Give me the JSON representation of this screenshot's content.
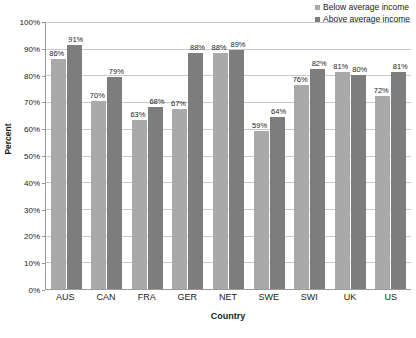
{
  "chart_data": {
    "type": "bar",
    "title": "",
    "xlabel": "Country",
    "ylabel": "Percent",
    "ylim": [
      0,
      100
    ],
    "y_ticks": [
      "0%",
      "10%",
      "20%",
      "30%",
      "40%",
      "50%",
      "60%",
      "70%",
      "80%",
      "90%",
      "100%"
    ],
    "grid": "horizontal",
    "legend_position": "top-right",
    "categories": [
      "AUS",
      "CAN",
      "FRA",
      "GER",
      "NET",
      "SWE",
      "SWI",
      "UK",
      "US"
    ],
    "series": [
      {
        "name": "Below average income",
        "color": "#a9a9a9",
        "values": [
          86,
          70,
          63,
          67,
          88,
          59,
          76,
          81,
          72
        ],
        "labels": [
          "86%",
          "70%",
          "63%",
          "67%",
          "88%",
          "59%",
          "76%",
          "81%",
          "72%"
        ]
      },
      {
        "name": "Above average income",
        "color": "#7d7d7d",
        "values": [
          91,
          79,
          68,
          88,
          89,
          64,
          82,
          80,
          81
        ],
        "labels": [
          "91%",
          "79%",
          "68%",
          "88%",
          "89%",
          "64%",
          "82%",
          "80%",
          "81%"
        ]
      }
    ]
  },
  "colors": {
    "axis": "#9a9a9a",
    "gridline": "#c9c9c9",
    "text": "#1a1a1a",
    "background": "#ffffff"
  }
}
